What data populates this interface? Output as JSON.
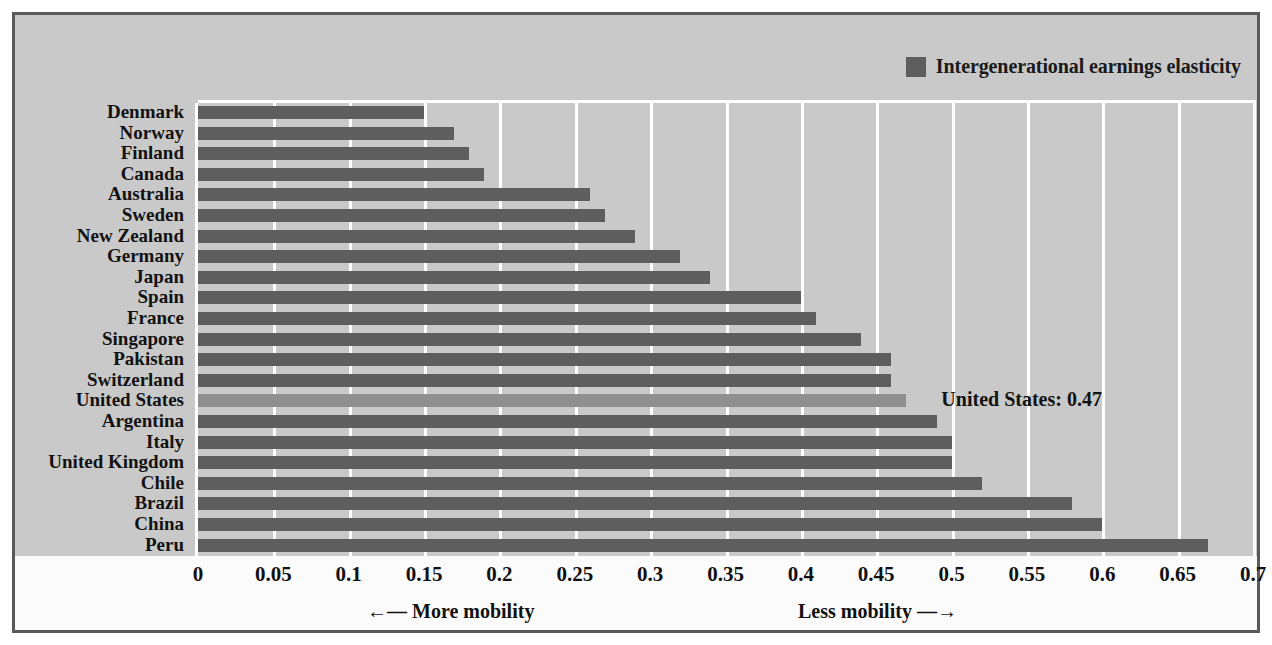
{
  "legend": {
    "swatch_icon": "legend-swatch-icon",
    "label": "Intergenerational earnings elasticity",
    "color": "#5e5e5e"
  },
  "annotation": {
    "text": "United States: 0.47"
  },
  "axis": {
    "more_mobility": "←— More mobility",
    "less_mobility": "Less mobility —→",
    "tick_labels": [
      "0",
      "0.05",
      "0.1",
      "0.15",
      "0.2",
      "0.25",
      "0.3",
      "0.35",
      "0.4",
      "0.45",
      "0.5",
      "0.55",
      "0.6",
      "0.65",
      "0.7"
    ]
  },
  "chart_data": {
    "type": "bar",
    "orientation": "horizontal",
    "title": "",
    "xlabel": "",
    "ylabel": "",
    "xlim": [
      0,
      0.7
    ],
    "xticks": [
      0,
      0.05,
      0.1,
      0.15,
      0.2,
      0.25,
      0.3,
      0.35,
      0.4,
      0.45,
      0.5,
      0.55,
      0.6,
      0.65,
      0.7
    ],
    "grid": true,
    "legend_position": "top-right",
    "series_name": "Intergenerational earnings elasticity",
    "categories": [
      "Denmark",
      "Norway",
      "Finland",
      "Canada",
      "Australia",
      "Sweden",
      "New Zealand",
      "Germany",
      "Japan",
      "Spain",
      "France",
      "Singapore",
      "Pakistan",
      "Switzerland",
      "United States",
      "Argentina",
      "Italy",
      "United Kingdom",
      "Chile",
      "Brazil",
      "China",
      "Peru"
    ],
    "values": [
      0.15,
      0.17,
      0.18,
      0.19,
      0.26,
      0.27,
      0.29,
      0.32,
      0.34,
      0.4,
      0.41,
      0.44,
      0.46,
      0.46,
      0.47,
      0.49,
      0.5,
      0.5,
      0.52,
      0.58,
      0.6,
      0.67
    ],
    "highlight_category": "United States",
    "highlight_color": "#8f8f8f",
    "bar_color": "#5e5e5e",
    "annotations": [
      {
        "text": "United States: 0.47",
        "category": "United States",
        "value": 0.47
      }
    ]
  }
}
